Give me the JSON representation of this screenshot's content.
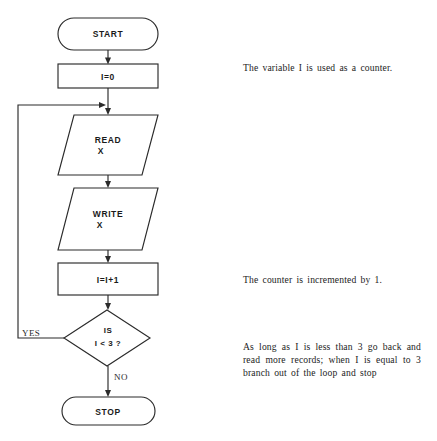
{
  "diagram": {
    "background_color": "#ffffff",
    "line_color": "#2b2b2b",
    "nodes": {
      "start": {
        "label": "START",
        "shape": "terminator"
      },
      "init": {
        "label": "I=0",
        "shape": "process"
      },
      "read": {
        "label_line1": "READ",
        "label_line2": "X",
        "shape": "input-output"
      },
      "write": {
        "label_line1": "WRITE",
        "label_line2": "X",
        "shape": "input-output"
      },
      "increment": {
        "label": "I=I+1",
        "shape": "process"
      },
      "decision": {
        "label_line1": "IS",
        "label_line2": "I < 3 ?",
        "shape": "decision"
      },
      "stop": {
        "label": "STOP",
        "shape": "terminator"
      }
    },
    "branches": {
      "yes": "YES",
      "no": "NO"
    }
  },
  "annotations": {
    "counter": "The variable I is used as a counter.",
    "increment": "The counter is incremented by 1.",
    "loop": "As long as I is less than 3 go back and read more records; when I is equal to 3 branch out of the loop and stop"
  }
}
